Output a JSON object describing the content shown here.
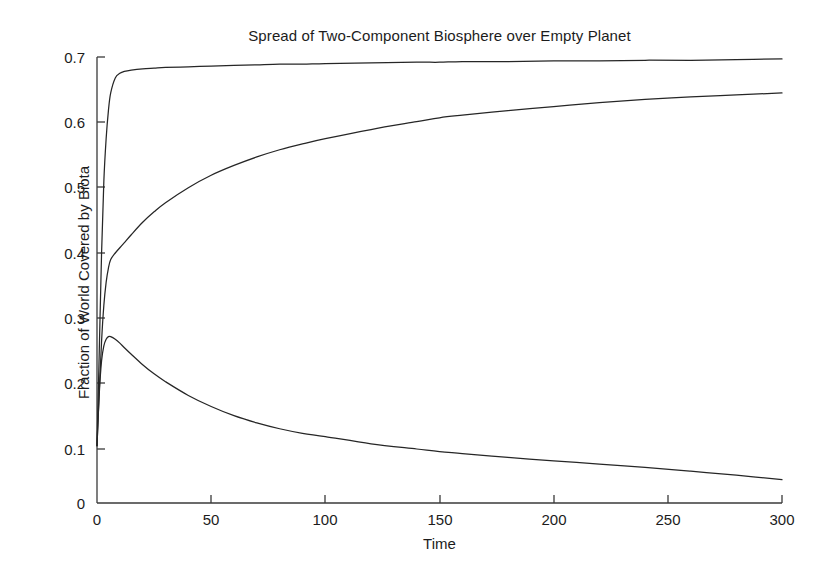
{
  "chart_data": {
    "type": "line",
    "title": "Spread of Two-Component Biosphere over Empty Planet",
    "xlabel": "Time",
    "ylabel": "Fraction of World Covered by Biota",
    "xlim": [
      0,
      300
    ],
    "ylim": [
      0,
      0.7
    ],
    "grid": false,
    "legend": "none",
    "xticks": [
      0,
      50,
      100,
      150,
      200,
      250,
      300
    ],
    "xtick_labels": [
      "0",
      "50",
      "100",
      "150",
      "200",
      "250",
      "300"
    ],
    "yticks": [
      0,
      0.1,
      0.2,
      0.3,
      0.4,
      0.5,
      0.6,
      0.7
    ],
    "ytick_labels": [
      "0",
      "0.1",
      "0.2",
      "0.3",
      "0.4",
      "0.5",
      "0.6",
      "0.7"
    ],
    "line_color": "#262626",
    "background_color": "#ffffff",
    "x": [
      0,
      1,
      2,
      3,
      4,
      5,
      6,
      8,
      10,
      12,
      15,
      20,
      25,
      30,
      40,
      50,
      60,
      70,
      80,
      90,
      100,
      120,
      140,
      150,
      160,
      180,
      200,
      220,
      240,
      260,
      280,
      300
    ],
    "series": [
      {
        "name": "total-biota-coverage",
        "values": [
          0.105,
          0.25,
          0.4,
          0.51,
          0.575,
          0.618,
          0.645,
          0.668,
          0.675,
          0.678,
          0.68,
          0.682,
          0.683,
          0.684,
          0.685,
          0.686,
          0.687,
          0.688,
          0.689,
          0.689,
          0.69,
          0.691,
          0.692,
          0.692,
          0.693,
          0.693,
          0.694,
          0.694,
          0.695,
          0.695,
          0.696,
          0.697
        ]
      },
      {
        "name": "component-one-coverage",
        "values": [
          0.105,
          0.19,
          0.265,
          0.32,
          0.355,
          0.377,
          0.39,
          0.4,
          0.408,
          0.416,
          0.428,
          0.447,
          0.463,
          0.477,
          0.5,
          0.519,
          0.534,
          0.547,
          0.558,
          0.567,
          0.575,
          0.589,
          0.601,
          0.607,
          0.611,
          0.618,
          0.624,
          0.63,
          0.635,
          0.639,
          0.642,
          0.645
        ]
      },
      {
        "name": "component-two-coverage",
        "values": [
          0.105,
          0.185,
          0.235,
          0.258,
          0.268,
          0.272,
          0.272,
          0.268,
          0.262,
          0.255,
          0.245,
          0.229,
          0.215,
          0.203,
          0.182,
          0.165,
          0.151,
          0.14,
          0.131,
          0.124,
          0.119,
          0.108,
          0.1,
          0.096,
          0.093,
          0.087,
          0.082,
          0.077,
          0.072,
          0.066,
          0.06,
          0.053
        ]
      }
    ],
    "annotations": []
  },
  "figure": {
    "name": "matlab-line-plot"
  }
}
